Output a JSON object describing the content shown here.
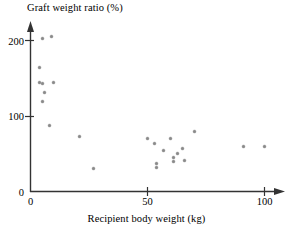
{
  "chart_data": {
    "type": "scatter",
    "title": "",
    "xlabel": "Recipient body weight (kg)",
    "ylabel": "Graft weight ratio (%)",
    "xlim": [
      0,
      110
    ],
    "ylim": [
      0,
      225
    ],
    "grid": false,
    "legend": "none",
    "xticks": [
      0,
      50,
      100
    ],
    "xtick_labels": [
      "0",
      "50",
      "100"
    ],
    "yticks": [
      0,
      100,
      200
    ],
    "ytick_labels": [
      "0",
      "100",
      "200"
    ],
    "marker_color": "#8a8a8a",
    "axis_color": "#333333",
    "points": [
      {
        "x": 5,
        "y": 202
      },
      {
        "x": 9,
        "y": 205
      },
      {
        "x": 4,
        "y": 164
      },
      {
        "x": 4,
        "y": 145
      },
      {
        "x": 5,
        "y": 143
      },
      {
        "x": 10,
        "y": 145
      },
      {
        "x": 6,
        "y": 131
      },
      {
        "x": 5,
        "y": 120
      },
      {
        "x": 8,
        "y": 88
      },
      {
        "x": 21,
        "y": 73
      },
      {
        "x": 27,
        "y": 31
      },
      {
        "x": 50,
        "y": 71
      },
      {
        "x": 53,
        "y": 64
      },
      {
        "x": 54,
        "y": 33
      },
      {
        "x": 54,
        "y": 37
      },
      {
        "x": 57,
        "y": 55
      },
      {
        "x": 60,
        "y": 71
      },
      {
        "x": 61,
        "y": 40
      },
      {
        "x": 61,
        "y": 46
      },
      {
        "x": 63,
        "y": 51
      },
      {
        "x": 65,
        "y": 58
      },
      {
        "x": 66,
        "y": 42
      },
      {
        "x": 70,
        "y": 80
      },
      {
        "x": 91,
        "y": 60
      },
      {
        "x": 100,
        "y": 60
      }
    ]
  },
  "axis_titles": {
    "y": "Graft weight ratio (%)",
    "x": "Recipient body weight (kg)"
  }
}
